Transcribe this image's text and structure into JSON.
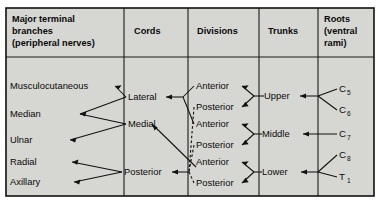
{
  "figure": {
    "background_color": "#d6d6d2",
    "border_color": "#111111",
    "line_color": "#111111"
  },
  "columns": [
    {
      "id": "branches",
      "header_lines": [
        "Major terminal",
        "branches",
        "(peripheral nerves)"
      ]
    },
    {
      "id": "cords",
      "header_lines": [
        "Cords"
      ]
    },
    {
      "id": "divisions",
      "header_lines": [
        "Divisions"
      ]
    },
    {
      "id": "trunks",
      "header_lines": [
        "Trunks"
      ]
    },
    {
      "id": "roots",
      "header_lines": [
        "Roots",
        "(ventral",
        "rami)"
      ]
    }
  ],
  "branches": [
    {
      "label": "Musculocutaneous"
    },
    {
      "label": "Median"
    },
    {
      "label": "Ulnar"
    },
    {
      "label": "Radial"
    },
    {
      "label": "Axillary"
    }
  ],
  "cords": [
    {
      "label": "Lateral"
    },
    {
      "label": "Medial"
    },
    {
      "label": "Posterior"
    }
  ],
  "divisions": [
    {
      "label": "Anterior"
    },
    {
      "label": "Posterior"
    },
    {
      "label": "Anterior"
    },
    {
      "label": "Posterior"
    },
    {
      "label": "Anterior"
    },
    {
      "label": "Posterior"
    }
  ],
  "trunks": [
    {
      "label": "Upper"
    },
    {
      "label": "Middle"
    },
    {
      "label": "Lower"
    }
  ],
  "roots": [
    {
      "letter": "C",
      "subscript": "5"
    },
    {
      "letter": "C",
      "subscript": "6"
    },
    {
      "letter": "C",
      "subscript": "7"
    },
    {
      "letter": "C",
      "subscript": "8"
    },
    {
      "letter": "T",
      "subscript": "1"
    }
  ]
}
